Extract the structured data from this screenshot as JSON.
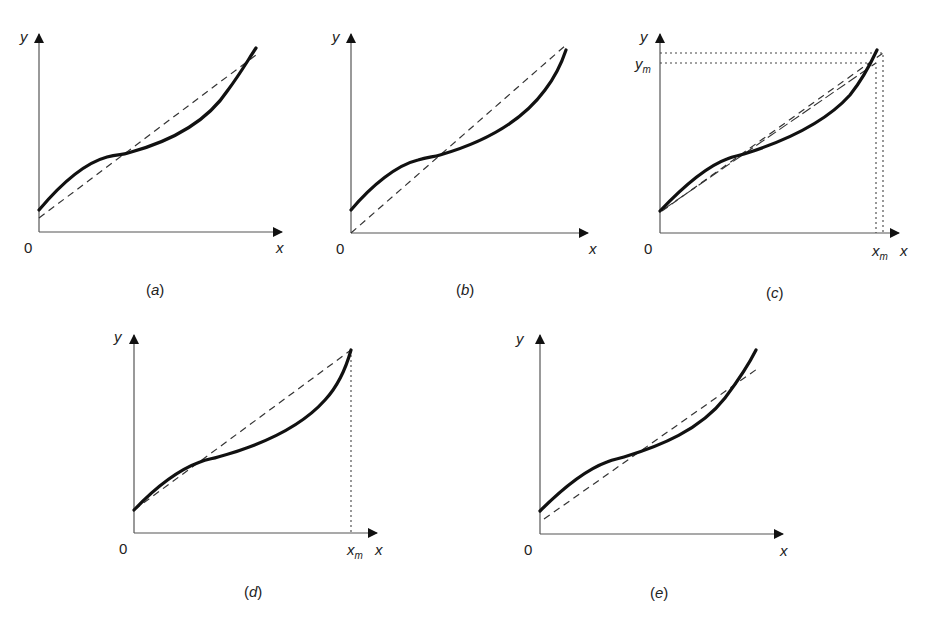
{
  "figure": {
    "panels": [
      {
        "id": "a",
        "caption_open": "(",
        "caption_letter": "a",
        "caption_close": ")",
        "y_label": "y",
        "x_label": "x",
        "origin_label": "0",
        "chord": "dashed line crossing the curve at three points, starting above origin and ending slightly below curve end"
      },
      {
        "id": "b",
        "caption_open": "(",
        "caption_letter": "b",
        "caption_close": ")",
        "y_label": "y",
        "x_label": "x",
        "origin_label": "0",
        "chord": "dashed line from origin to the curve end point"
      },
      {
        "id": "c",
        "caption_open": "(",
        "caption_letter": "c",
        "caption_close": ")",
        "y_label": "y",
        "x_label": "x",
        "origin_label": "0",
        "ym_label": "y",
        "ym_sub": "m",
        "xm_label": "x",
        "xm_sub": "m",
        "chord": "dashed line from curve start to near curve end with dotted guides to x_m and y_m"
      },
      {
        "id": "d",
        "caption_open": "(",
        "caption_letter": "d",
        "caption_close": ")",
        "y_label": "y",
        "x_label": "x",
        "origin_label": "0",
        "xm_label": "x",
        "xm_sub": "m",
        "chord": "dashed line from curve start to curve end at x_m with dotted vertical guide"
      },
      {
        "id": "e",
        "caption_open": "(",
        "caption_letter": "e",
        "caption_close": ")",
        "y_label": "y",
        "x_label": "x",
        "origin_label": "0",
        "chord": "dashed least-squares-like line crossing the curve, starting below curve start"
      }
    ],
    "colors": {
      "curve": "#111111",
      "axis": "#555555",
      "dashed": "#333333",
      "background": "#ffffff"
    }
  }
}
